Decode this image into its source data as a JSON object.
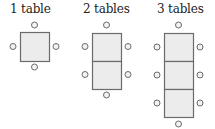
{
  "colors": {
    "table_fill": "#ececec",
    "table_stroke": "#6b6b6b",
    "chair_fill": "#f2f2f2",
    "chair_stroke": "#6b6b6b",
    "text": "#222222"
  },
  "groups": [
    {
      "label": "1 table",
      "label_x": 10,
      "tables": 1,
      "table_x": 20,
      "table_y": 32,
      "table_w": 29,
      "table_h": 29,
      "chairs": [
        {
          "x": 34.5,
          "y": 25
        },
        {
          "x": 34.5,
          "y": 67
        },
        {
          "x": 13,
          "y": 46.5
        },
        {
          "x": 56,
          "y": 46.5
        }
      ]
    },
    {
      "label": "2 tables",
      "label_x": 83,
      "tables": 2,
      "table_x": 92,
      "table_y": 33,
      "table_w": 29,
      "table_h": 28,
      "chairs": [
        {
          "x": 106.5,
          "y": 25
        },
        {
          "x": 106.5,
          "y": 95
        },
        {
          "x": 85,
          "y": 46.5
        },
        {
          "x": 85,
          "y": 74.5
        },
        {
          "x": 128,
          "y": 46.5
        },
        {
          "x": 128,
          "y": 74.5
        }
      ]
    },
    {
      "label": "3 tables",
      "label_x": 157,
      "tables": 3,
      "table_x": 164,
      "table_y": 33,
      "table_w": 29,
      "table_h": 28,
      "chairs": [
        {
          "x": 178.5,
          "y": 25
        },
        {
          "x": 178.5,
          "y": 124
        },
        {
          "x": 157,
          "y": 47
        },
        {
          "x": 157,
          "y": 75
        },
        {
          "x": 157,
          "y": 103
        },
        {
          "x": 200,
          "y": 47
        },
        {
          "x": 200,
          "y": 75
        },
        {
          "x": 200,
          "y": 103
        }
      ]
    }
  ]
}
